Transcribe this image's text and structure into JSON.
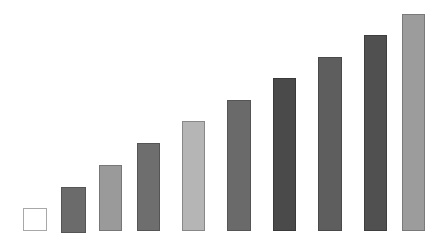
{
  "chart_data": {
    "type": "bar",
    "title": "",
    "xlabel": "",
    "ylabel": "",
    "grid": false,
    "legend": null,
    "categories": [
      "1",
      "2",
      "3",
      "4",
      "5",
      "6",
      "7",
      "8",
      "9",
      "10"
    ],
    "values": [
      1,
      2,
      3,
      4,
      5,
      6,
      7,
      8,
      9,
      10
    ],
    "ylim": [
      0,
      10
    ],
    "bar_colors": [
      "#ffffff",
      "#6b6b6b",
      "#9a9a9a",
      "#6e6e6e",
      "#b5b5b5",
      "#6a6a6a",
      "#4a4a4a",
      "#5e5e5e",
      "#505050",
      "#9c9c9c"
    ],
    "bar_borders": [
      "#a8a8a8",
      "#555555",
      "#777777",
      "#555555",
      "#888888",
      "#555555",
      "#3a3a3a",
      "#4a4a4a",
      "#3e3e3e",
      "#7a7a7a"
    ],
    "bar_layout": [
      {
        "x": 23,
        "w": 24,
        "top": 208,
        "bottom": 231
      },
      {
        "x": 61,
        "w": 25,
        "top": 187,
        "bottom": 233
      },
      {
        "x": 99,
        "w": 23,
        "top": 165,
        "bottom": 231
      },
      {
        "x": 137,
        "w": 23,
        "top": 143,
        "bottom": 231
      },
      {
        "x": 182,
        "w": 23,
        "top": 121,
        "bottom": 231
      },
      {
        "x": 227,
        "w": 24,
        "top": 100,
        "bottom": 231
      },
      {
        "x": 273,
        "w": 23,
        "top": 78,
        "bottom": 231
      },
      {
        "x": 318,
        "w": 24,
        "top": 57,
        "bottom": 231
      },
      {
        "x": 364,
        "w": 23,
        "top": 35,
        "bottom": 231
      },
      {
        "x": 402,
        "w": 23,
        "top": 14,
        "bottom": 231
      }
    ]
  }
}
